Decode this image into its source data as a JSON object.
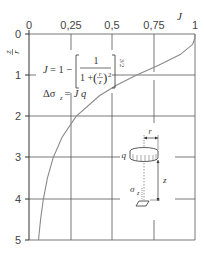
{
  "chart_data": {
    "type": "line",
    "title": "",
    "xlabel": "J",
    "ylabel": "z/r",
    "x_ticks": [
      "0",
      "0,25",
      "0,5",
      "0,75",
      "1"
    ],
    "y_ticks": [
      "0",
      "1",
      "2",
      "3",
      "4",
      "5"
    ],
    "xlim": [
      0,
      1
    ],
    "ylim": [
      0,
      5
    ],
    "y_inverted": true,
    "x_axis_position": "top",
    "grid": true,
    "series": [
      {
        "name": "J",
        "color": "#888888",
        "points": [
          {
            "z_over_r": 0.0,
            "J": 1.0
          },
          {
            "z_over_r": 0.1,
            "J": 0.999
          },
          {
            "z_over_r": 0.25,
            "J": 0.986
          },
          {
            "z_over_r": 0.5,
            "J": 0.911
          },
          {
            "z_over_r": 0.75,
            "J": 0.784
          },
          {
            "z_over_r": 1.0,
            "J": 0.646
          },
          {
            "z_over_r": 1.25,
            "J": 0.524
          },
          {
            "z_over_r": 1.5,
            "J": 0.424
          },
          {
            "z_over_r": 2.0,
            "J": 0.284
          },
          {
            "z_over_r": 2.5,
            "J": 0.2
          },
          {
            "z_over_r": 3.0,
            "J": 0.146
          },
          {
            "z_over_r": 3.5,
            "J": 0.111
          },
          {
            "z_over_r": 4.0,
            "J": 0.087
          },
          {
            "z_over_r": 4.5,
            "J": 0.07
          },
          {
            "z_over_r": 5.0,
            "J": 0.057
          }
        ]
      }
    ],
    "annotations": {
      "formula_lhs": "J = 1 −",
      "formula_num": "1",
      "formula_den_prefix": "1 +",
      "formula_r": "r",
      "formula_z": "z",
      "formula_sq": "2",
      "formula_exp": "3/2",
      "stress_eq": "Δσ",
      "stress_sub": "z",
      "stress_rhs": "= J q"
    },
    "inset": {
      "load_label": "q",
      "radius_label": "r",
      "depth_label": "z",
      "stress_label": "σ",
      "stress_sub": "z"
    }
  }
}
